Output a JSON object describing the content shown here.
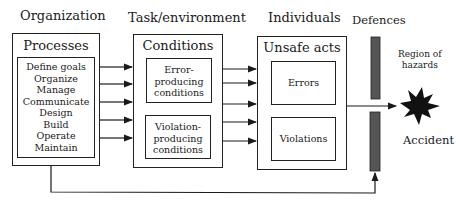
{
  "columns": {
    "organization": "Organization",
    "task_environment": "Task/environment",
    "individuals": "Individuals",
    "defences": "Defences"
  },
  "processes": {
    "title": "Processes",
    "items": [
      "Define goals",
      "Organize",
      "Manage",
      "Communicate",
      "Design",
      "Build",
      "Operate",
      "Maintain"
    ]
  },
  "conditions": {
    "title": "Conditions",
    "error": [
      "Error-",
      "producing",
      "conditions"
    ],
    "violation": [
      "Violation-",
      "producing",
      "conditions"
    ]
  },
  "unsafe_acts": {
    "title": "Unsafe acts",
    "errors": "Errors",
    "violations": "Violations"
  },
  "hazards": [
    "Region of",
    "hazards"
  ],
  "accident": "Accident",
  "colors": {
    "line": "#1a1a1a",
    "defence_bar": "#555555"
  }
}
